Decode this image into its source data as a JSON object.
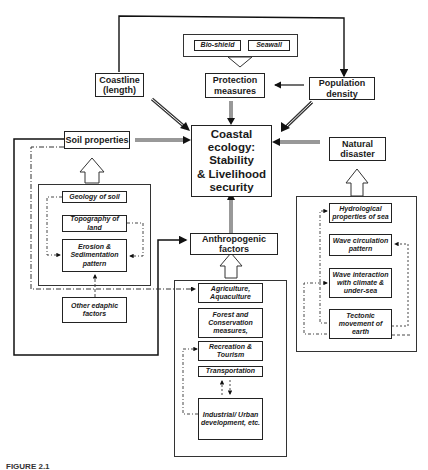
{
  "diagram": {
    "center": {
      "line1": "Coastal",
      "line2": "ecology:",
      "line3": "Stability",
      "line4": "& Livelihood",
      "line5": "security"
    },
    "top_nodes": {
      "coastline": {
        "line1": "Coastline",
        "line2": "(length)"
      },
      "protection": {
        "line1": "Protection",
        "line2": "measures"
      },
      "population": {
        "line1": "Population",
        "line2": "density"
      },
      "protection_items": [
        "Bio-shield",
        "Seawall"
      ]
    },
    "soil": {
      "title": "Soil properties",
      "items": [
        "Geology of soil",
        "Topography of land",
        "Erosion & Sedimentation pattern",
        "Other edaphic factors"
      ]
    },
    "natural": {
      "title_line1": "Natural",
      "title_line2": "disaster",
      "items": [
        "Hydrological properties of sea",
        "Wave circulation pattern",
        "Wave interaction with climate & under-sea",
        "Tectonic movement of earth"
      ]
    },
    "anthropogenic": {
      "title_line1": "Anthropogenic",
      "title_line2": "factors",
      "items": [
        "Agriculture, Aquaculture",
        "Forest and Conservation measures,",
        "Recreation & Tourism",
        "Transportation",
        "Industrial/ Urban development, etc."
      ]
    },
    "caption": "FIGURE 2.1"
  }
}
